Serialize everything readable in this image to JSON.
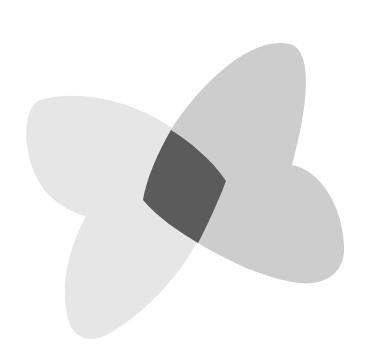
{
  "diagram": {
    "type": "overlapping-shapes",
    "background": "#ffffff",
    "shapes": [
      {
        "id": "left-petal-shape",
        "fill": "#e6e6e6",
        "description": "light grey curved shape: upper-left lobe and lower lobe"
      },
      {
        "id": "right-petal-shape",
        "fill": "#cdcdcd",
        "description": "medium grey curved shape: upper lobe and right lobe"
      },
      {
        "id": "intersection-region",
        "fill": "#5b5b5b",
        "description": "dark grey overlap area"
      }
    ]
  }
}
